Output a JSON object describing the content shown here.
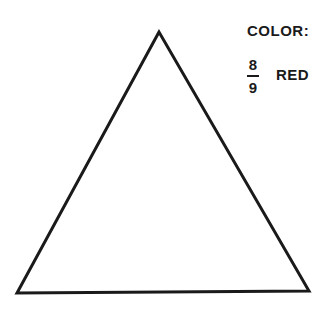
{
  "legend": {
    "heading": "COLOR:",
    "fraction": {
      "numerator": "8",
      "denominator": "9"
    },
    "color_name": "RED"
  },
  "figure": {
    "shape": "triangle",
    "vertices": [
      [
        159,
        32
      ],
      [
        17,
        293
      ],
      [
        309,
        291
      ]
    ],
    "stroke": "#1a1a1a",
    "fill": "none"
  }
}
